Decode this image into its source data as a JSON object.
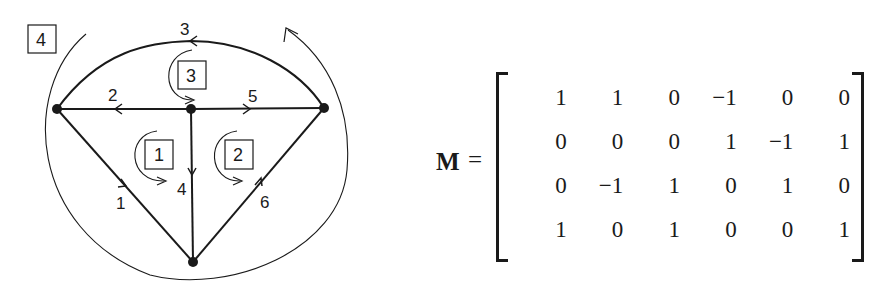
{
  "graph": {
    "mesh_labels": [
      "1",
      "2",
      "3",
      "4"
    ],
    "branch_labels": [
      "1",
      "2",
      "3",
      "4",
      "5",
      "6"
    ],
    "nodes": 4
  },
  "matrix": {
    "name": "M",
    "equals": "=",
    "rows": [
      [
        "1",
        "1",
        "0",
        "−1",
        "0",
        "0"
      ],
      [
        "0",
        "0",
        "0",
        "1",
        "−1",
        "1"
      ],
      [
        "0",
        "−1",
        "1",
        "0",
        "1",
        "0"
      ],
      [
        "1",
        "0",
        "1",
        "0",
        "0",
        "1"
      ]
    ]
  }
}
